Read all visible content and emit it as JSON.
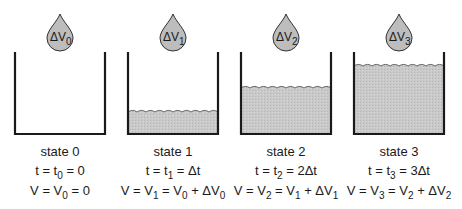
{
  "colors": {
    "fill": "#c8c8c8",
    "stroke": "#1a1a1a",
    "drop_fill": "#bdbdbd"
  },
  "states": [
    {
      "name": "state 0",
      "drop": {
        "delta": "ΔV",
        "sub": "0"
      },
      "fill_level_y": null,
      "time": {
        "lhs": "t = t",
        "sub": "0",
        "rhs": " = 0"
      },
      "volume": {
        "parts": [
          {
            "t": "V = V"
          },
          {
            "s": "0"
          },
          {
            "t": " = 0"
          }
        ]
      },
      "cx": 60
    },
    {
      "name": "state 1",
      "drop": {
        "delta": "ΔV",
        "sub": "1"
      },
      "fill_level_y": 112,
      "time": {
        "lhs": "t = t",
        "sub": "1",
        "rhs": " = Δt"
      },
      "volume": {
        "parts": [
          {
            "t": "V = V"
          },
          {
            "s": "1"
          },
          {
            "t": " = V"
          },
          {
            "s": "0"
          },
          {
            "t": " + ΔV"
          },
          {
            "s": "0"
          }
        ]
      },
      "cx": 173
    },
    {
      "name": "state 2",
      "drop": {
        "delta": "ΔV",
        "sub": "2"
      },
      "fill_level_y": 88,
      "time": {
        "lhs": "t = t",
        "sub": "2",
        "rhs": " = 2Δt"
      },
      "volume": {
        "parts": [
          {
            "t": "V = V"
          },
          {
            "s": "2"
          },
          {
            "t": " = V"
          },
          {
            "s": "1"
          },
          {
            "t": " + ΔV"
          },
          {
            "s": "1"
          }
        ]
      },
      "cx": 286
    },
    {
      "name": "state 3",
      "drop": {
        "delta": "ΔV",
        "sub": "3"
      },
      "fill_level_y": 66,
      "time": {
        "lhs": "t = t",
        "sub": "3",
        "rhs": " = 3Δt"
      },
      "volume": {
        "parts": [
          {
            "t": "V = V"
          },
          {
            "s": "3"
          },
          {
            "t": " = V"
          },
          {
            "s": "2"
          },
          {
            "t": " + ΔV"
          },
          {
            "s": "2"
          }
        ]
      },
      "cx": 399
    }
  ]
}
